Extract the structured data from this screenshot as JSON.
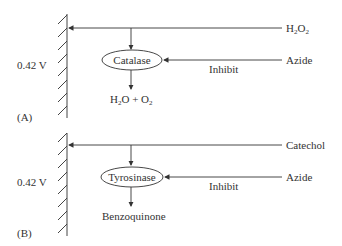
{
  "panels": [
    {
      "id": "A",
      "panel_label": "(A)",
      "potential": "0.42 V",
      "substrate": {
        "main": "H",
        "sub1": "2",
        "mid": "O",
        "sub2": "2"
      },
      "enzyme": "Catalase",
      "inhibitor": "Azide",
      "inhibit_label": "Inhibit",
      "product": {
        "a": "H",
        "a_sub": "2",
        "b": "O + O",
        "b_sub": "2"
      }
    },
    {
      "id": "B",
      "panel_label": "(B)",
      "potential": "0.42 V",
      "substrate_text": "Catechol",
      "enzyme": "Tyrosinase",
      "inhibitor": "Azide",
      "inhibit_label": "Inhibit",
      "product_text": "Benzoquinone"
    }
  ],
  "colors": {
    "line": "#333333",
    "text": "#333333",
    "background": "#ffffff"
  }
}
